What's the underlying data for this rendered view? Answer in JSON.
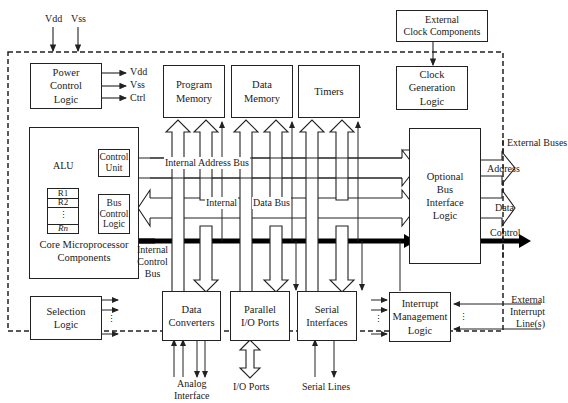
{
  "diagram": {
    "supply_inputs": [
      "Vdd",
      "Vss"
    ],
    "external_clock": "External\nClock Components",
    "blocks": {
      "power_control": {
        "label": "Power\nControl\nLogic",
        "outputs": [
          "Vdd",
          "Vss",
          "Ctrl"
        ]
      },
      "program_memory": {
        "label": "Program\nMemory"
      },
      "data_memory": {
        "label": "Data\nMemory"
      },
      "timers": {
        "label": "Timers"
      },
      "clock_generation": {
        "label": "Clock\nGeneration\nLogic"
      },
      "core": {
        "label": "Core Microprocessor\nComponents",
        "alu": "ALU",
        "control_unit": "Control\nUnit",
        "bus_control": "Bus\nControl\nLogic",
        "registers": [
          "R1",
          "R2",
          "⋮",
          "Rn"
        ]
      },
      "bus_interface": {
        "label": "Optional\nBus\nInterface\nLogic"
      },
      "selection_logic": {
        "label": "Selection\nLogic"
      },
      "data_converters": {
        "label": "Data\nConverters"
      },
      "parallel_io": {
        "label": "Parallel\nI/O Ports"
      },
      "serial_interfaces": {
        "label": "Serial\nInterfaces"
      },
      "interrupt_mgmt": {
        "label": "Interrupt\nManagement\nLogic"
      }
    },
    "buses": {
      "address": "Internal Address Bus",
      "data_left": "Internal",
      "data_right": "Data Bus",
      "control": "Internal\nControl\nBus"
    },
    "external_buses": {
      "title": "External Buses",
      "address": "Address",
      "data": "Data",
      "control": "Control"
    },
    "external_labels": {
      "analog": "Analog\nInterface",
      "io_ports": "I/O Ports",
      "serial_lines": "Serial Lines",
      "interrupt_lines": "External\nInterrupt\nLine(s)"
    },
    "ellipsis": "⋮"
  }
}
